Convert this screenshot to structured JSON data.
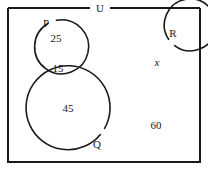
{
  "diagram": {
    "type": "venn",
    "title": "",
    "universe": {
      "label": "U",
      "outside_count": "60"
    },
    "sets": [
      {
        "key": "P",
        "label": "P"
      },
      {
        "key": "Q",
        "label": "Q"
      },
      {
        "key": "R",
        "label": "R"
      }
    ],
    "regions": [
      {
        "name": "P only",
        "value": "25"
      },
      {
        "name": "P and Q overlap",
        "value": "15"
      },
      {
        "name": "Q only",
        "value": "45"
      },
      {
        "name": "R only",
        "value": "x"
      },
      {
        "name": "outside all sets",
        "value": "60"
      }
    ],
    "colors": {
      "stroke": "#1a1a1a",
      "background": "#ffffff",
      "text": "#1a1a1a"
    }
  }
}
